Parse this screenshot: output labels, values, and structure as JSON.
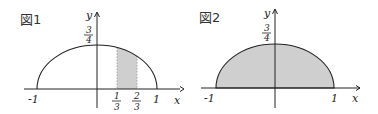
{
  "figures": [
    {
      "title": "図1",
      "axis_x_label": "x",
      "axis_y_label": "y",
      "y_max_label": {
        "num": "3",
        "den": "4"
      },
      "x_ticks": [
        "-1",
        "1"
      ],
      "shade_ticks": [
        {
          "num": "1",
          "den": "3"
        },
        {
          "num": "2",
          "den": "3"
        }
      ],
      "curve": "upper half-ellipse y = (3/4)√(1−x²), −1 ≤ x ≤ 1",
      "shaded_region": "1/3 ≤ x ≤ 2/3 under curve"
    },
    {
      "title": "図2",
      "axis_x_label": "x",
      "axis_y_label": "y",
      "y_max_label": {
        "num": "3",
        "den": "4"
      },
      "x_ticks": [
        "-1",
        "1"
      ],
      "curve": "upper half-ellipse y = (3/4)√(1−x²), −1 ≤ x ≤ 1",
      "shaded_region": "entire region −1 ≤ x ≤ 1 under curve"
    }
  ],
  "colors": {
    "stroke": "#222222",
    "shade": "#cfcfcf",
    "shade_dotted": "#999999"
  }
}
